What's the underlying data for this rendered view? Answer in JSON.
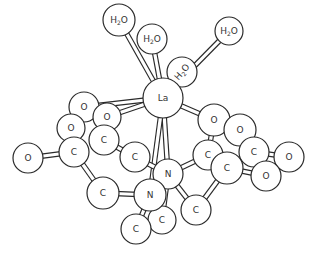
{
  "diagram": {
    "title": "",
    "central_atom": "La",
    "atoms": [
      {
        "id": "w1",
        "label": "H2O",
        "x": 119,
        "y": 20,
        "r": 16
      },
      {
        "id": "w2",
        "label": "H2O",
        "x": 152,
        "y": 39,
        "r": 15
      },
      {
        "id": "w3",
        "label": "H2O",
        "x": 229,
        "y": 31,
        "r": 14
      },
      {
        "id": "w4",
        "label": "H2O",
        "x": 182,
        "y": 72,
        "r": 15
      },
      {
        "id": "o1",
        "label": "O",
        "x": 84,
        "y": 107,
        "r": 15
      },
      {
        "id": "o2",
        "label": "O",
        "x": 107,
        "y": 117,
        "r": 14
      },
      {
        "id": "o3",
        "label": "O",
        "x": 71,
        "y": 128,
        "r": 14
      },
      {
        "id": "c1",
        "label": "C",
        "x": 104,
        "y": 140,
        "r": 15
      },
      {
        "id": "c2",
        "label": "C",
        "x": 74,
        "y": 152,
        "r": 15
      },
      {
        "id": "o4",
        "label": "O",
        "x": 28,
        "y": 158,
        "r": 15
      },
      {
        "id": "c3",
        "label": "C",
        "x": 135,
        "y": 157,
        "r": 15
      },
      {
        "id": "c4",
        "label": "C",
        "x": 103,
        "y": 193,
        "r": 16
      },
      {
        "id": "o5",
        "label": "O",
        "x": 214,
        "y": 120,
        "r": 16
      },
      {
        "id": "o6",
        "label": "O",
        "x": 240,
        "y": 130,
        "r": 16
      },
      {
        "id": "c5",
        "label": "C",
        "x": 254,
        "y": 152,
        "r": 15
      },
      {
        "id": "o7",
        "label": "O",
        "x": 289,
        "y": 157,
        "r": 15
      },
      {
        "id": "c6",
        "label": "C",
        "x": 208,
        "y": 155,
        "r": 15
      },
      {
        "id": "c7",
        "label": "C",
        "x": 227,
        "y": 168,
        "r": 16
      },
      {
        "id": "o8",
        "label": "O",
        "x": 266,
        "y": 176,
        "r": 15
      },
      {
        "id": "n1",
        "label": "N",
        "x": 168,
        "y": 174,
        "r": 15
      },
      {
        "id": "c8",
        "label": "C",
        "x": 196,
        "y": 210,
        "r": 15
      },
      {
        "id": "c9",
        "label": "C",
        "x": 162,
        "y": 220,
        "r": 14
      },
      {
        "id": "n2",
        "label": "N",
        "x": 150,
        "y": 195,
        "r": 16
      },
      {
        "id": "c10",
        "label": "C",
        "x": 136,
        "y": 229,
        "r": 15
      },
      {
        "id": "la",
        "label": "La",
        "x": 163,
        "y": 98,
        "r": 20
      }
    ],
    "bonds": [
      [
        "la",
        "w1"
      ],
      [
        "la",
        "w2"
      ],
      [
        "la",
        "w3"
      ],
      [
        "la",
        "w4"
      ],
      [
        "la",
        "o1"
      ],
      [
        "la",
        "o2"
      ],
      [
        "la",
        "o5"
      ],
      [
        "la",
        "n1"
      ],
      [
        "la",
        "n2"
      ],
      [
        "o1",
        "c2"
      ],
      [
        "o2",
        "c1"
      ],
      [
        "o3",
        "c2"
      ],
      [
        "c2",
        "o4"
      ],
      [
        "c2",
        "c4"
      ],
      [
        "c1",
        "c3"
      ],
      [
        "c4",
        "n2"
      ],
      [
        "c3",
        "n1"
      ],
      [
        "o5",
        "c6"
      ],
      [
        "o6",
        "c5"
      ],
      [
        "c5",
        "o7"
      ],
      [
        "c5",
        "o8"
      ],
      [
        "c6",
        "c7"
      ],
      [
        "c7",
        "o8"
      ],
      [
        "n1",
        "c6"
      ],
      [
        "c7",
        "c8"
      ],
      [
        "c8",
        "n1"
      ],
      [
        "n2",
        "c9"
      ],
      [
        "n2",
        "c10"
      ],
      [
        "n1",
        "c9"
      ]
    ]
  }
}
